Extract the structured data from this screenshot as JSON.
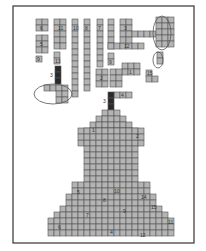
{
  "figure": {
    "type": "tangram-style block puzzle",
    "cell_size": 6,
    "frame": {
      "x": 13,
      "y": 6,
      "w": 181,
      "h": 237
    },
    "fill_color": "#b4b4b4",
    "dark_color": "#2a2a2a",
    "pieces": [
      {
        "label": "6",
        "x": 36,
        "y": 19,
        "cols": 2,
        "rows": 2
      },
      {
        "label": "5",
        "x": 36,
        "y": 35,
        "cols": 2,
        "rows": 3
      },
      {
        "label": "9",
        "x": 36,
        "y": 56,
        "cols": 1,
        "rows": 1
      },
      {
        "label": "11",
        "x": 54,
        "y": 19,
        "cols": 2,
        "rows": 5
      },
      {
        "label": "13",
        "x": 54,
        "y": 52,
        "cols": 1,
        "rows": 2
      },
      {
        "label": "10",
        "x": 72,
        "y": 19,
        "cols": 1,
        "rows": 13
      },
      {
        "label": "8",
        "x": 84,
        "y": 19,
        "cols": 1,
        "rows": 12
      },
      {
        "label": "7",
        "x": 97,
        "y": 19,
        "cols": 1,
        "rows": 8
      },
      {
        "label": "",
        "x": 108,
        "y": 19,
        "cols": 1,
        "rows": 5
      },
      {
        "label": "12",
        "x": 108,
        "y": 43,
        "cols": 6,
        "rows": 1
      },
      {
        "label": "3",
        "x": 120,
        "y": 19,
        "cols": 2,
        "rows": 4
      },
      {
        "label": "",
        "x": 132,
        "y": 31,
        "cols": 4,
        "rows": 1
      },
      {
        "label": "",
        "x": 156,
        "y": 17,
        "cols": 3,
        "rows": 5
      },
      {
        "label": "",
        "x": 157,
        "y": 52,
        "cols": 1,
        "rows": 2
      },
      {
        "label": "9",
        "x": 108,
        "y": 53,
        "cols": 1,
        "rows": 2
      },
      {
        "label": "1",
        "x": 122,
        "y": 63,
        "cols": 3,
        "rows": 2
      },
      {
        "label": "2",
        "x": 96,
        "y": 69,
        "cols": 2,
        "rows": 3
      },
      {
        "label": "",
        "x": 110,
        "y": 69,
        "cols": 2,
        "rows": 3
      },
      {
        "label": "15",
        "x": 146,
        "y": 70,
        "cols": 1,
        "rows": 1
      },
      {
        "label": "15b",
        "x": 146,
        "y": 76,
        "cols": 2,
        "rows": 1
      },
      {
        "label": "4",
        "x": 114,
        "y": 92,
        "cols": 3,
        "rows": 1
      },
      {
        "label": "",
        "x": 44,
        "y": 85,
        "cols": 2,
        "rows": 1
      },
      {
        "label": "",
        "x": 56,
        "y": 85,
        "cols": 2,
        "rows": 3
      }
    ],
    "dark_pieces": [
      {
        "label": "3",
        "x": 55,
        "y": 66,
        "cols": 1,
        "rows": 3
      },
      {
        "label": "3",
        "x": 108,
        "y": 92,
        "cols": 1,
        "rows": 4
      }
    ],
    "ovals": [
      {
        "cx": 162,
        "cy": 33,
        "rx": 9,
        "ry": 17
      },
      {
        "cx": 158,
        "cy": 60,
        "rx": 5,
        "ry": 8
      },
      {
        "cx": 53,
        "cy": 94,
        "rx": 19,
        "ry": 10
      }
    ],
    "silhouette": {
      "label": "figure silhouette",
      "rows": [
        {
          "y": 110,
          "x0": 102,
          "x1": 120
        },
        {
          "y": 116,
          "x0": 96,
          "x1": 126
        },
        {
          "y": 122,
          "x0": 90,
          "x1": 132
        },
        {
          "y": 128,
          "x0": 84,
          "x1": 138
        },
        {
          "y": 134,
          "x0": 84,
          "x1": 138
        },
        {
          "y": 140,
          "x0": 78,
          "x1": 144
        },
        {
          "y": 146,
          "x0": 84,
          "x1": 138
        },
        {
          "y": 152,
          "x0": 84,
          "x1": 138
        },
        {
          "y": 158,
          "x0": 84,
          "x1": 138
        },
        {
          "y": 164,
          "x0": 84,
          "x1": 138
        },
        {
          "y": 170,
          "x0": 84,
          "x1": 138
        },
        {
          "y": 176,
          "x0": 84,
          "x1": 138
        },
        {
          "y": 182,
          "x0": 72,
          "x1": 150
        },
        {
          "y": 188,
          "x0": 72,
          "x1": 150
        },
        {
          "y": 194,
          "x0": 66,
          "x1": 156
        },
        {
          "y": 200,
          "x0": 66,
          "x1": 156
        },
        {
          "y": 206,
          "x0": 60,
          "x1": 162
        },
        {
          "y": 212,
          "x0": 54,
          "x1": 168
        },
        {
          "y": 218,
          "x0": 48,
          "x1": 174
        },
        {
          "y": 224,
          "x0": 48,
          "x1": 174
        },
        {
          "y": 230,
          "x0": 48,
          "x1": 174
        }
      ],
      "shoulder_rows": [
        {
          "y": 128,
          "x0": 78,
          "x1": 144
        },
        {
          "y": 134,
          "x0": 78,
          "x1": 144
        }
      ],
      "labels": [
        {
          "text": "1",
          "x": 92,
          "y": 132
        },
        {
          "text": "2",
          "x": 136,
          "y": 138
        },
        {
          "text": "5",
          "x": 77,
          "y": 194
        },
        {
          "text": "10",
          "x": 114,
          "y": 193
        },
        {
          "text": "14",
          "x": 141,
          "y": 199
        },
        {
          "text": "8",
          "x": 103,
          "y": 202
        },
        {
          "text": "15",
          "x": 151,
          "y": 209
        },
        {
          "text": "7",
          "x": 86,
          "y": 217
        },
        {
          "text": "9",
          "x": 123,
          "y": 213
        },
        {
          "text": "11",
          "x": 168,
          "y": 224
        },
        {
          "text": "6",
          "x": 58,
          "y": 229
        },
        {
          "text": "4",
          "x": 110,
          "y": 234
        },
        {
          "text": "12",
          "x": 140,
          "y": 237
        }
      ]
    }
  }
}
